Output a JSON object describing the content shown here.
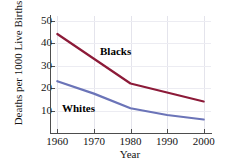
{
  "chart_data": {
    "type": "line",
    "title": "",
    "xlabel": "Year",
    "ylabel": "Deaths per 1000 Live Births",
    "x": [
      1960,
      1970,
      1980,
      1990,
      2000
    ],
    "xlim": [
      1958,
      2002
    ],
    "ylim": [
      0,
      52
    ],
    "xticks": [
      1960,
      1970,
      1980,
      1990,
      2000
    ],
    "xticklabels": [
      "1960",
      "1970",
      "1980",
      "1990",
      "2000"
    ],
    "yticks": [
      10,
      20,
      30,
      40,
      50
    ],
    "yticklabels": [
      "10",
      "20",
      "30",
      "40",
      "50"
    ],
    "grid": "vertical-and-horizontal-faint",
    "legend_position": "inline-annotations",
    "series": [
      {
        "name": "Blacks",
        "color": "#8c1a38",
        "values": [
          44.0,
          33.0,
          22.0,
          18.0,
          14.0
        ],
        "annotation": "Blacks"
      },
      {
        "name": "Whites",
        "color": "#6b74b8",
        "values": [
          23.0,
          17.5,
          11.0,
          8.0,
          6.0
        ],
        "annotation": "Whites"
      }
    ]
  },
  "axes": {
    "y_title": "Deaths per 1000 Live Births",
    "x_title": "Year"
  }
}
